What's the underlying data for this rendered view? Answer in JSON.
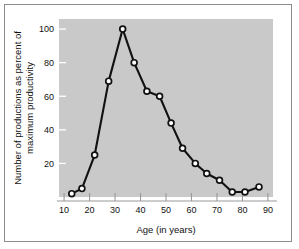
{
  "chart_data": {
    "type": "line",
    "title": "",
    "xlabel": "Age (in years)",
    "ylabel": "Number of productions as percent of maximum productivity",
    "ylabel_line1": "Number of productions as percent of",
    "ylabel_line2": "maximum productivity",
    "xlim": [
      8,
      92
    ],
    "ylim": [
      0,
      106
    ],
    "xticks": [
      10,
      20,
      30,
      40,
      50,
      60,
      70,
      80,
      90
    ],
    "yticks": [
      20,
      40,
      60,
      80,
      100
    ],
    "xtick_labels": [
      "10",
      "20",
      "30",
      "40",
      "50",
      "60",
      "70",
      "80",
      "90"
    ],
    "ytick_labels": [
      "20",
      "40",
      "60",
      "80",
      "100"
    ],
    "grid": false,
    "legend": "none",
    "marker": "open-circle",
    "line_color": "#111111",
    "marker_fill": "#ffffff",
    "plot_background": "#c9c9c9",
    "x": [
      13,
      17,
      22,
      27.5,
      33,
      37.5,
      42.5,
      47.5,
      52,
      56.5,
      61.5,
      66,
      71,
      76,
      81,
      86.5
    ],
    "values": [
      2,
      5,
      25,
      69,
      100,
      80,
      63,
      60,
      44,
      29,
      20,
      14,
      10,
      3,
      3,
      6
    ],
    "points": [
      {
        "age": 13,
        "percent": 2
      },
      {
        "age": 17,
        "percent": 5
      },
      {
        "age": 22,
        "percent": 25
      },
      {
        "age": 27.5,
        "percent": 69
      },
      {
        "age": 33,
        "percent": 100
      },
      {
        "age": 37.5,
        "percent": 80
      },
      {
        "age": 42.5,
        "percent": 63
      },
      {
        "age": 47.5,
        "percent": 60
      },
      {
        "age": 52,
        "percent": 44
      },
      {
        "age": 56.5,
        "percent": 29
      },
      {
        "age": 61.5,
        "percent": 20
      },
      {
        "age": 66,
        "percent": 14
      },
      {
        "age": 71,
        "percent": 10
      },
      {
        "age": 76,
        "percent": 3
      },
      {
        "age": 81,
        "percent": 3
      },
      {
        "age": 86.5,
        "percent": 6
      }
    ]
  }
}
